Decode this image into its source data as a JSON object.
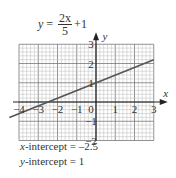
{
  "equation": {
    "lhs": "y",
    "equals": "=",
    "numerator": "2x",
    "denominator": "5",
    "tail": "+1"
  },
  "axes": {
    "x_label": "x",
    "y_label": "y",
    "x_ticks": [
      "-4",
      "-3",
      "-2",
      "-1",
      "0",
      "1",
      "2",
      "3"
    ],
    "y_ticks": [
      "3",
      "2",
      "1",
      "-1",
      "-2"
    ]
  },
  "line": {
    "slope": 0.4,
    "intercept": 1,
    "color": "#555555"
  },
  "annotations": {
    "x_intercept_var": "x",
    "x_intercept_text": "-intercept = –2.5",
    "y_intercept_var": "y",
    "y_intercept_text": "-intercept = 1"
  }
}
